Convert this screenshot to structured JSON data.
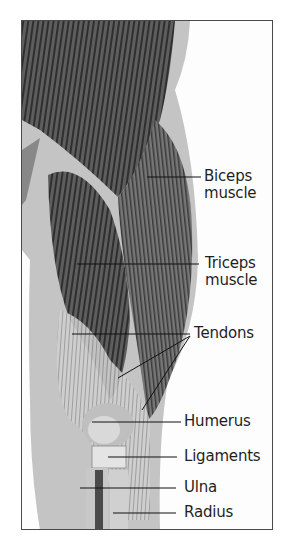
{
  "figure": {
    "type": "anatomical-illustration",
    "labels": [
      {
        "id": "biceps",
        "line1": "Biceps",
        "line2": "muscle"
      },
      {
        "id": "triceps",
        "line1": "Triceps",
        "line2": "muscle"
      },
      {
        "id": "tendons",
        "line1": "Tendons"
      },
      {
        "id": "humerus",
        "line1": "Humerus"
      },
      {
        "id": "ligaments",
        "line1": "Ligaments"
      },
      {
        "id": "ulna",
        "line1": "Ulna"
      },
      {
        "id": "radius",
        "line1": "Radius"
      }
    ],
    "colors": {
      "frame": "#4a4a4a",
      "muscle_dark": "#3c3c3c",
      "muscle_mid": "#6e6e6e",
      "skin_shadow": "#bdbdbd",
      "bone": "#d9d9d9",
      "leader_line": "#111111",
      "text": "#1f1f1f"
    }
  }
}
